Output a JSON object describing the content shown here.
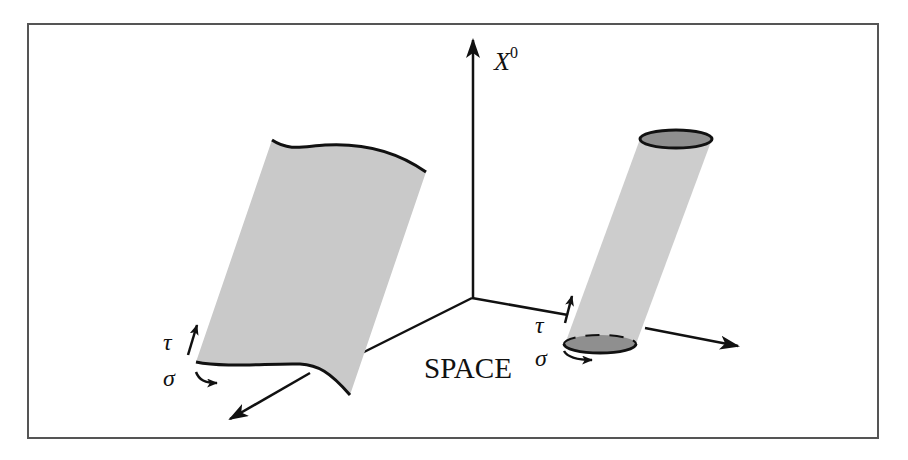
{
  "figure": {
    "frame": {
      "x": 28,
      "y": 24,
      "width": 850,
      "height": 414,
      "stroke": "#555555"
    },
    "colors": {
      "line": "#111111",
      "sheet_fill": "#c9c9c9",
      "tube_fill": "#cdcdcd",
      "tube_cap_fill": "#8f8f8f",
      "background": "#ffffff"
    },
    "axes": {
      "time_axis_label": "X",
      "time_axis_superscript": "0",
      "space_label": "SPACE"
    },
    "open_string": {
      "description": "open string worldsheet",
      "tau_label": "τ",
      "sigma_label": "σ"
    },
    "closed_string": {
      "description": "closed string worldsheet (tube)",
      "tau_label": "τ",
      "sigma_label": "σ"
    }
  }
}
